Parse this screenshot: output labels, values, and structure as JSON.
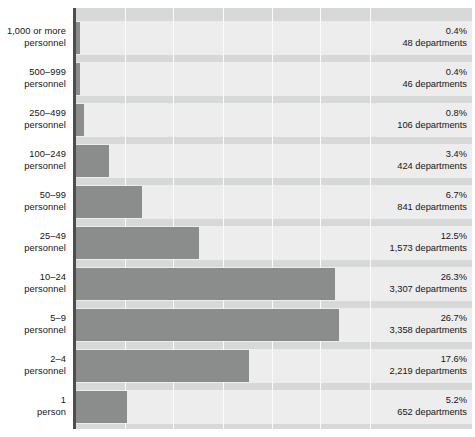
{
  "chart_data": {
    "type": "bar",
    "orientation": "horizontal",
    "title": "",
    "subtitle": "",
    "xlabel": "",
    "ylabel": "",
    "grid": true,
    "legend": null,
    "xlim": [
      0,
      40
    ],
    "xtick_step_percent": 5,
    "categories": [
      "1,000 or more personnel",
      "500–999 personnel",
      "250–499 personnel",
      "100–249 personnel",
      "50–99 personnel",
      "25–49 personnel",
      "10–24 personnel",
      "5–9 personnel",
      "2–4 personnel",
      "1 person"
    ],
    "values": [
      0.4,
      0.4,
      0.8,
      3.4,
      6.7,
      12.5,
      26.3,
      26.7,
      17.6,
      5.2
    ],
    "counts": [
      48,
      46,
      106,
      424,
      841,
      1573,
      3307,
      3358,
      2219,
      652
    ],
    "value_unit": "percent",
    "count_unit": "departments"
  },
  "colors": {
    "bar": "#8b8c8c",
    "row_background": "#ededee",
    "band": "#d7d8d8",
    "gridline": "#fbfbfb",
    "axis": "#4d4d4d",
    "text": "#151515",
    "page_background": "#ffffff"
  },
  "rows": [
    {
      "label_line1": "1,000 or more",
      "label_line2": "personnel",
      "percent_label": "0.4%",
      "count_label": "48 departments"
    },
    {
      "label_line1": "500–999",
      "label_line2": "personnel",
      "percent_label": "0.4%",
      "count_label": "46 departments"
    },
    {
      "label_line1": "250–499",
      "label_line2": "personnel",
      "percent_label": "0.8%",
      "count_label": "106 departments"
    },
    {
      "label_line1": "100–249",
      "label_line2": "personnel",
      "percent_label": "3.4%",
      "count_label": "424 departments"
    },
    {
      "label_line1": "50–99",
      "label_line2": "personnel",
      "percent_label": "6.7%",
      "count_label": "841 departments"
    },
    {
      "label_line1": "25–49",
      "label_line2": "personnel",
      "percent_label": "12.5%",
      "count_label": "1,573 departments"
    },
    {
      "label_line1": "10–24",
      "label_line2": "personnel",
      "percent_label": "26.3%",
      "count_label": "3,307 departments"
    },
    {
      "label_line1": "5–9",
      "label_line2": "personnel",
      "percent_label": "26.7%",
      "count_label": "3,358 departments"
    },
    {
      "label_line1": "2–4",
      "label_line2": "personnel",
      "percent_label": "17.6%",
      "count_label": "2,219 departments"
    },
    {
      "label_line1": "1",
      "label_line2": "person",
      "percent_label": "5.2%",
      "count_label": "652 departments"
    }
  ],
  "geometry": {
    "plot_left": 73,
    "plot_top": 8,
    "plot_width": 399,
    "plot_height": 421,
    "bar_origin_x": 3,
    "px_per_percent": 9.84,
    "row_height": 34,
    "band_height": 7,
    "first_band_height": 13,
    "gridline_x_positions": [
      52,
      100,
      150,
      199,
      247,
      297
    ]
  }
}
